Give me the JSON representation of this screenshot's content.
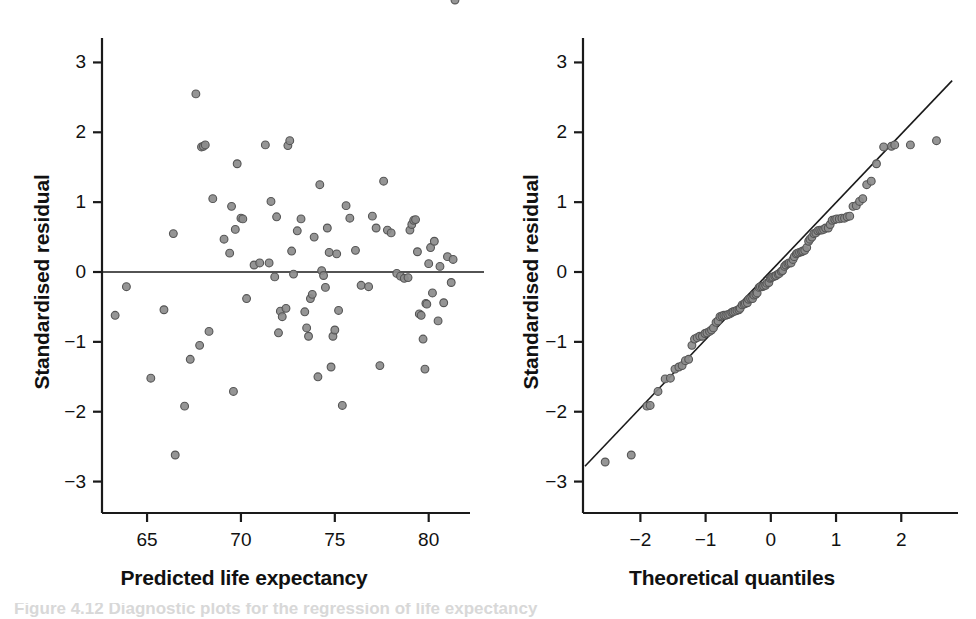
{
  "figure": {
    "background": "#ffffff",
    "marker_fill": "#8c8c8c",
    "marker_stroke": "#555555",
    "axis_color": "#1a1a1a",
    "caption_fragment": "Figure 4.12  Diagnostic plots for the regression of life expectancy"
  },
  "chart_data": [
    {
      "type": "scatter",
      "panel": "left",
      "title": "",
      "xlabel": "Predicted life expectancy",
      "ylabel": "Standardised residual",
      "xlim": [
        62.6,
        82.2
      ],
      "ylim": [
        -3.45,
        3.35
      ],
      "xticks": [
        65,
        70,
        75,
        80
      ],
      "xticklabels": [
        "65",
        "70",
        "75",
        "80"
      ],
      "yticks": [
        3,
        2,
        1,
        0,
        -1,
        -2,
        -3
      ],
      "yticklabels": [
        "3",
        "2",
        "1",
        "0",
        "-1",
        "-2",
        "-3"
      ],
      "grid": false,
      "legend": "none",
      "reference_line": {
        "type": "horizontal",
        "y": 0
      },
      "x": [
        63.3,
        63.9,
        65.2,
        65.9,
        66.4,
        66.5,
        67.0,
        67.3,
        67.6,
        67.8,
        67.9,
        68.0,
        68.1,
        68.3,
        68.5,
        69.1,
        69.4,
        69.5,
        69.6,
        69.7,
        69.8,
        70.0,
        70.1,
        70.3,
        70.7,
        71.0,
        71.3,
        71.5,
        71.6,
        71.8,
        71.9,
        72.0,
        72.1,
        72.2,
        72.4,
        72.5,
        72.6,
        72.7,
        72.8,
        73.0,
        73.2,
        73.4,
        73.5,
        73.6,
        73.7,
        73.8,
        73.9,
        74.1,
        74.2,
        74.3,
        74.4,
        74.5,
        74.6,
        74.7,
        74.8,
        74.9,
        75.0,
        75.1,
        75.2,
        75.4,
        75.6,
        75.8,
        76.1,
        76.4,
        76.8,
        77.0,
        77.2,
        77.4,
        77.6,
        77.8,
        78.0,
        78.3,
        78.5,
        78.7,
        78.9,
        79.0,
        79.1,
        79.2,
        79.3,
        79.4,
        79.5,
        79.6,
        79.7,
        79.8,
        79.85,
        79.9,
        80.0,
        80.1,
        80.2,
        80.3,
        80.5,
        80.6,
        80.8,
        81.0,
        81.2,
        81.3,
        81.4
      ],
      "y": [
        -0.62,
        -0.21,
        -1.52,
        -0.54,
        0.55,
        -2.62,
        -1.92,
        -1.25,
        2.55,
        -1.05,
        1.79,
        1.8,
        1.82,
        -0.85,
        1.05,
        0.47,
        0.27,
        0.94,
        -1.71,
        0.61,
        1.55,
        0.77,
        0.76,
        -0.38,
        0.1,
        0.13,
        1.82,
        0.13,
        1.01,
        -0.07,
        0.79,
        -0.87,
        -0.56,
        -0.64,
        -0.52,
        1.81,
        1.88,
        0.3,
        -0.03,
        0.59,
        0.76,
        -0.57,
        -0.8,
        -0.92,
        -0.38,
        -0.32,
        0.5,
        -1.5,
        1.25,
        0.02,
        -0.05,
        -0.22,
        0.63,
        0.28,
        -1.36,
        -0.92,
        -0.83,
        0.26,
        -0.55,
        -1.91,
        0.95,
        0.77,
        0.31,
        -0.19,
        -0.21,
        0.8,
        0.63,
        -1.34,
        1.3,
        0.6,
        0.56,
        -0.02,
        -0.06,
        -0.09,
        -0.08,
        0.6,
        0.68,
        0.74,
        0.75,
        0.29,
        -0.6,
        -0.62,
        -0.96,
        -1.39,
        -0.45,
        -0.46,
        0.12,
        0.35,
        -0.3,
        0.44,
        -0.7,
        0.08,
        -0.44,
        0.22,
        -0.15,
        0.18
      ]
    },
    {
      "type": "scatter",
      "panel": "right",
      "title": "",
      "xlabel": "Theoretical quantiles",
      "ylabel": "Standardised residual",
      "xlim": [
        -2.88,
        2.87
      ],
      "ylim": [
        -3.45,
        3.35
      ],
      "xticks": [
        -2,
        -1,
        0,
        1,
        2
      ],
      "xticklabels": [
        "-2",
        "-1",
        "0",
        "1",
        "2"
      ],
      "yticks": [
        3,
        2,
        1,
        0,
        -1,
        -2,
        -3
      ],
      "yticklabels": [
        "3",
        "2",
        "1",
        "0",
        "-1",
        "-2",
        "-3"
      ],
      "grid": false,
      "legend": "none",
      "reference_line": {
        "type": "qq",
        "x0": -2.85,
        "y0": -2.78,
        "x1": 2.78,
        "y1": 2.74
      },
      "x": [
        -2.54,
        -2.14,
        -1.9,
        -1.85,
        -1.73,
        -1.62,
        -1.54,
        -1.47,
        -1.41,
        -1.36,
        -1.31,
        -1.26,
        -1.21,
        -1.17,
        -1.13,
        -1.09,
        -1.05,
        -1.01,
        -0.98,
        -0.94,
        -0.91,
        -0.88,
        -0.84,
        -0.81,
        -0.78,
        -0.75,
        -0.72,
        -0.69,
        -0.66,
        -0.63,
        -0.6,
        -0.58,
        -0.55,
        -0.52,
        -0.49,
        -0.47,
        -0.44,
        -0.41,
        -0.39,
        -0.36,
        -0.34,
        -0.31,
        -0.28,
        -0.26,
        -0.23,
        -0.21,
        -0.18,
        -0.16,
        -0.13,
        -0.11,
        -0.08,
        -0.06,
        -0.03,
        -0.01,
        0.01,
        0.03,
        0.06,
        0.08,
        0.11,
        0.13,
        0.16,
        0.18,
        0.21,
        0.23,
        0.26,
        0.28,
        0.31,
        0.34,
        0.36,
        0.39,
        0.41,
        0.44,
        0.47,
        0.49,
        0.52,
        0.55,
        0.58,
        0.6,
        0.63,
        0.66,
        0.69,
        0.72,
        0.75,
        0.78,
        0.81,
        0.84,
        0.88,
        0.91,
        0.94,
        0.98,
        1.01,
        1.05,
        1.09,
        1.13,
        1.17,
        1.21,
        1.26,
        1.31,
        1.36,
        1.41,
        1.47,
        1.54,
        1.62,
        1.73,
        1.85,
        1.9,
        2.14,
        2.54
      ],
      "y": [
        -2.72,
        -2.62,
        -1.92,
        -1.91,
        -1.71,
        -1.53,
        -1.52,
        -1.39,
        -1.36,
        -1.34,
        -1.27,
        -1.25,
        -1.05,
        -0.96,
        -0.94,
        -0.92,
        -0.92,
        -0.88,
        -0.87,
        -0.85,
        -0.83,
        -0.8,
        -0.72,
        -0.7,
        -0.64,
        -0.63,
        -0.62,
        -0.62,
        -0.61,
        -0.6,
        -0.58,
        -0.57,
        -0.56,
        -0.55,
        -0.54,
        -0.52,
        -0.47,
        -0.46,
        -0.45,
        -0.44,
        -0.39,
        -0.38,
        -0.38,
        -0.33,
        -0.32,
        -0.3,
        -0.22,
        -0.21,
        -0.21,
        -0.2,
        -0.19,
        -0.16,
        -0.15,
        -0.09,
        -0.08,
        -0.07,
        -0.06,
        -0.05,
        -0.03,
        -0.02,
        0.01,
        0.02,
        0.08,
        0.1,
        0.12,
        0.13,
        0.13,
        0.18,
        0.22,
        0.26,
        0.27,
        0.28,
        0.29,
        0.3,
        0.31,
        0.35,
        0.44,
        0.47,
        0.5,
        0.55,
        0.56,
        0.59,
        0.6,
        0.6,
        0.61,
        0.63,
        0.63,
        0.68,
        0.74,
        0.75,
        0.76,
        0.76,
        0.77,
        0.77,
        0.79,
        0.8,
        0.94,
        0.95,
        1.01,
        1.05,
        1.25,
        1.3,
        1.55,
        1.79,
        1.8,
        1.82,
        1.82,
        1.88,
        2.55
      ]
    }
  ],
  "left_panel": {
    "x_axis_title": "Predicted life expectancy",
    "y_axis_title": "Standardised residual",
    "x_tick_labels": [
      "65",
      "70",
      "75",
      "80"
    ],
    "y_tick_labels": [
      "3",
      "2",
      "1",
      "0",
      "−1",
      "−2",
      "−3"
    ]
  },
  "right_panel": {
    "x_axis_title": "Theoretical quantiles",
    "y_axis_title": "Standardised residual",
    "x_tick_labels": [
      "−2",
      "−1",
      "0",
      "1",
      "2"
    ],
    "y_tick_labels": [
      "3",
      "2",
      "1",
      "0",
      "−1",
      "−2",
      "−3"
    ]
  }
}
